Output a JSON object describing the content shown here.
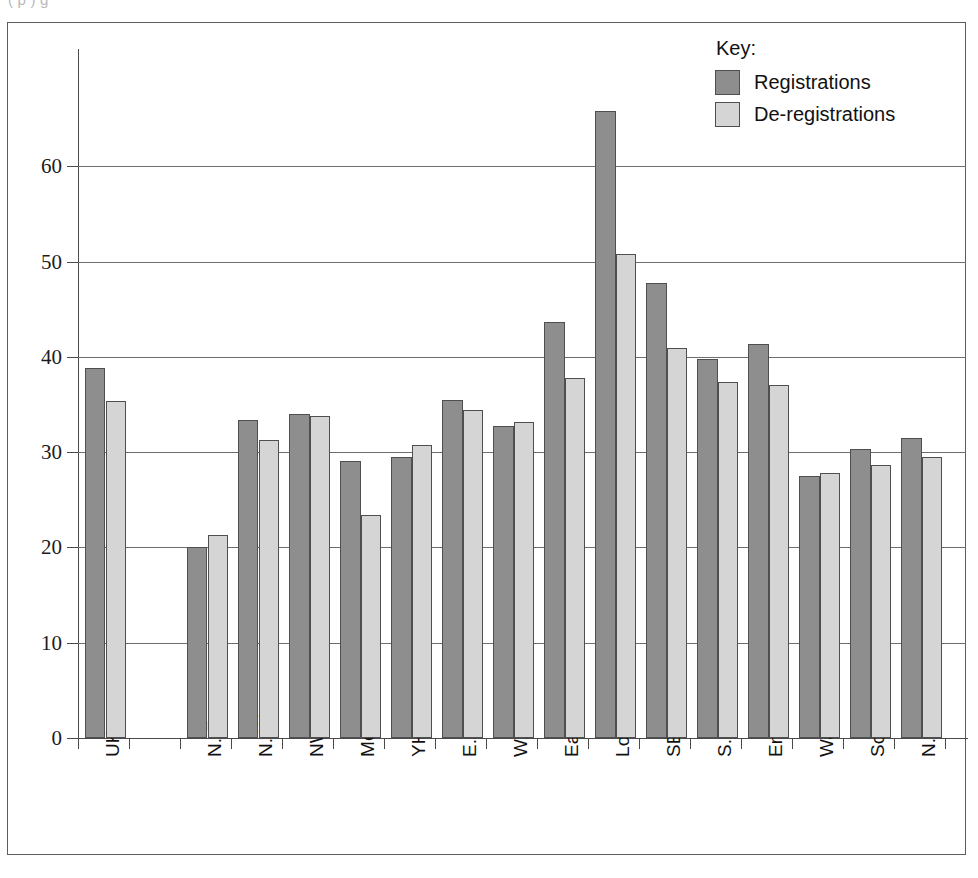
{
  "scan_artifact_text": "(  p    )                  g",
  "legend": {
    "title": "Key:",
    "entries": [
      {
        "label": "Registrations",
        "color": "#8e8e8e",
        "key": "registrations"
      },
      {
        "label": "De-registrations",
        "color": "#d5d5d5",
        "key": "deregistrations"
      }
    ]
  },
  "chart_data": {
    "type": "bar",
    "title": "",
    "xlabel": "",
    "ylabel": "",
    "ylim": [
      0,
      70
    ],
    "yticks": [
      0,
      10,
      20,
      30,
      40,
      50,
      60
    ],
    "ytick_labels": [
      "0",
      "10",
      "20",
      "30",
      "40",
      "50",
      "60"
    ],
    "grid": true,
    "legend_position": "top-right",
    "categories": [
      "UK",
      "",
      "N. East",
      "N. West",
      "NW (GOR)",
      "Merseyside",
      "YH",
      "E. Midlands",
      "W. Midlands",
      "Eastern",
      "London",
      "SE (GOR)",
      "S. West",
      "England",
      "Wales",
      "Scotland",
      "N. Ireland"
    ],
    "series": [
      {
        "name": "Registrations",
        "color": "#8e8e8e",
        "values": [
          38.8,
          null,
          20.0,
          33.4,
          34.0,
          29.1,
          29.5,
          35.5,
          32.7,
          43.7,
          65.8,
          47.7,
          39.8,
          41.4,
          27.5,
          30.3,
          31.5
        ]
      },
      {
        "name": "De-registrations",
        "color": "#d5d5d5",
        "values": [
          35.4,
          null,
          21.3,
          31.3,
          33.8,
          23.4,
          30.7,
          34.4,
          33.2,
          37.8,
          50.8,
          40.9,
          37.4,
          37.0,
          27.8,
          28.7,
          29.5
        ]
      }
    ]
  }
}
